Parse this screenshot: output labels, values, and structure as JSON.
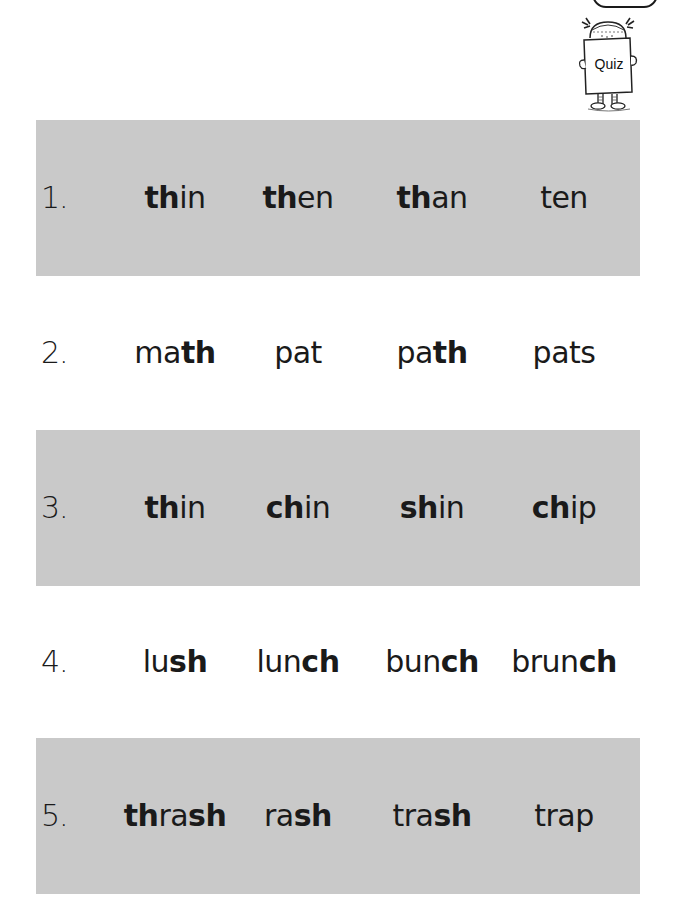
{
  "header": {
    "mascot_sign": "Quiz",
    "mascot_icon": "girl-holding-quiz-sign-icon"
  },
  "colors": {
    "band": "#c9c9c9",
    "text": "#1a1a1a",
    "background": "#ffffff"
  },
  "rows": [
    {
      "number": "1.",
      "shaded": true,
      "words": [
        {
          "bold": "th",
          "rest": "in",
          "pre": ""
        },
        {
          "bold": "th",
          "rest": "en",
          "pre": ""
        },
        {
          "bold": "th",
          "rest": "an",
          "pre": ""
        },
        {
          "bold": "",
          "rest": "ten",
          "pre": ""
        }
      ]
    },
    {
      "number": "2.",
      "shaded": false,
      "words": [
        {
          "pre": "ma",
          "bold": "th",
          "rest": ""
        },
        {
          "pre": "pat",
          "bold": "",
          "rest": ""
        },
        {
          "pre": "pa",
          "bold": "th",
          "rest": ""
        },
        {
          "pre": "pats",
          "bold": "",
          "rest": ""
        }
      ]
    },
    {
      "number": "3.",
      "shaded": true,
      "words": [
        {
          "pre": "",
          "bold": "th",
          "rest": "in"
        },
        {
          "pre": "",
          "bold": "ch",
          "rest": "in"
        },
        {
          "pre": "",
          "bold": "sh",
          "rest": "in"
        },
        {
          "pre": "",
          "bold": "ch",
          "rest": "ip"
        }
      ]
    },
    {
      "number": "4.",
      "shaded": false,
      "words": [
        {
          "pre": "lu",
          "bold": "sh",
          "rest": ""
        },
        {
          "pre": "lun",
          "bold": "ch",
          "rest": ""
        },
        {
          "pre": "bun",
          "bold": "ch",
          "rest": ""
        },
        {
          "pre": "brun",
          "bold": "ch",
          "rest": ""
        }
      ]
    },
    {
      "number": "5.",
      "shaded": true,
      "words": [
        {
          "pre": "",
          "bold": "th",
          "rest": "ra",
          "bold2": "sh"
        },
        {
          "pre": "ra",
          "bold": "sh",
          "rest": ""
        },
        {
          "pre": "tra",
          "bold": "sh",
          "rest": ""
        },
        {
          "pre": "trap",
          "bold": "",
          "rest": ""
        }
      ]
    }
  ]
}
